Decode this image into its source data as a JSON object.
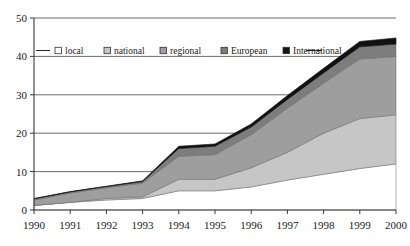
{
  "chart_data": {
    "type": "area",
    "stacked": true,
    "title": "",
    "subtitle": "",
    "xlabel": "",
    "ylabel": "",
    "categories": [
      "1990",
      "1991",
      "1992",
      "1993",
      "1994",
      "1995",
      "1996",
      "1997",
      "1998",
      "1999",
      "2000"
    ],
    "x": [
      1990,
      1991,
      1992,
      1993,
      1994,
      1995,
      1996,
      1997,
      1998,
      1999,
      2000
    ],
    "xlim": [
      1990,
      2000
    ],
    "ylim": [
      0,
      50
    ],
    "yticks": [
      0,
      10,
      20,
      30,
      40,
      50
    ],
    "xticks": [
      "1990",
      "1991",
      "1992",
      "1993",
      "1994",
      "1995",
      "1996",
      "1997",
      "1998",
      "1999",
      "2000"
    ],
    "grid": true,
    "grid_axis": "y",
    "legend_position": "top-inside",
    "series": [
      {
        "name": "local",
        "color": "#ffffff",
        "values": [
          1.2,
          2.0,
          2.6,
          3.0,
          5.0,
          5.0,
          6.0,
          7.8,
          9.3,
          10.8,
          12.0
        ]
      },
      {
        "name": "national",
        "color": "#c6c6c6",
        "values": [
          0.0,
          0.0,
          0.4,
          0.4,
          3.0,
          3.0,
          5.0,
          7.2,
          10.7,
          13.0,
          12.8
        ]
      },
      {
        "name": "regional",
        "color": "#9e9e9e",
        "values": [
          1.4,
          2.4,
          2.8,
          3.6,
          6.0,
          6.4,
          8.6,
          11.5,
          13.0,
          15.5,
          15.2
        ]
      },
      {
        "name": "European",
        "color": "#7d7d7d",
        "values": [
          0.3,
          0.3,
          0.3,
          0.4,
          2.0,
          2.2,
          2.0,
          2.3,
          2.7,
          3.2,
          3.2
        ]
      },
      {
        "name": "International",
        "color": "#111111",
        "values": [
          0.1,
          0.1,
          0.1,
          0.2,
          0.6,
          0.6,
          0.8,
          1.0,
          1.2,
          1.4,
          1.6
        ]
      }
    ],
    "totals": [
      3.0,
      4.8,
      6.2,
      7.6,
      16.6,
      17.2,
      22.4,
      29.8,
      36.9,
      43.9,
      44.8
    ]
  },
  "legend": {
    "items": [
      {
        "label": "local",
        "marker": "legend-swatch-local"
      },
      {
        "label": "national",
        "marker": "legend-swatch-national"
      },
      {
        "label": "regional",
        "marker": "legend-swatch-regional"
      },
      {
        "label": "European",
        "marker": "legend-swatch-european"
      },
      {
        "label": "International",
        "marker": "legend-swatch-international"
      }
    ]
  },
  "axis": {
    "y_labels": [
      "50",
      "40",
      "30",
      "20",
      "10",
      "0"
    ],
    "x_labels": [
      "1990",
      "1991",
      "1992",
      "1993",
      "1994",
      "1995",
      "1996",
      "1997",
      "1998",
      "1999",
      "2000"
    ]
  },
  "colors": {
    "axis": "#3a3a3a",
    "grid": "#5a5a5a",
    "text": "#1a1a1a",
    "plot_background": "#ffffff",
    "series_local": "#ffffff",
    "series_national": "#c6c6c6",
    "series_regional": "#9e9e9e",
    "series_european": "#7d7d7d",
    "series_international": "#111111"
  }
}
